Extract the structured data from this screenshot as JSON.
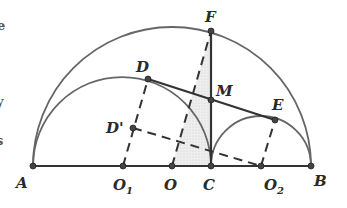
{
  "diagram": {
    "points": {
      "A": {
        "label": "A",
        "x": 33,
        "y": 166
      },
      "B": {
        "label": "B",
        "x": 311,
        "y": 166
      },
      "C": {
        "label": "C",
        "x": 211,
        "y": 166
      },
      "O": {
        "label": "O",
        "x": 172,
        "y": 166
      },
      "O1": {
        "label": "O",
        "sub": "1",
        "x": 123,
        "y": 166
      },
      "O2": {
        "label": "O",
        "sub": "2",
        "x": 261,
        "y": 166
      },
      "F": {
        "label": "F",
        "x": 211,
        "y": 31
      },
      "D": {
        "label": "D",
        "x": 148,
        "y": 79
      },
      "E": {
        "label": "E",
        "x": 275,
        "y": 120
      },
      "M": {
        "label": "M",
        "x": 211,
        "y": 100
      },
      "Dp": {
        "label": "D'",
        "x": 133,
        "y": 128
      }
    },
    "edge_text_fragments": [
      "e",
      "y",
      "s"
    ],
    "colors": {
      "line": "#333333",
      "arc": "#666666",
      "shade": "#e4e4e4",
      "point": "#444444"
    }
  }
}
